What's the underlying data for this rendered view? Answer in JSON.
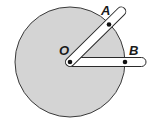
{
  "diagram": {
    "labels": {
      "center": "O",
      "point_a": "A",
      "point_b": "B"
    },
    "colors": {
      "disk_fill": "#d4d4d4",
      "disk_stroke": "#3a3a3a",
      "rod_fill": "#ffffff",
      "rod_stroke": "#2a2a2a",
      "dot": "#111111",
      "background": "#ffffff"
    }
  }
}
